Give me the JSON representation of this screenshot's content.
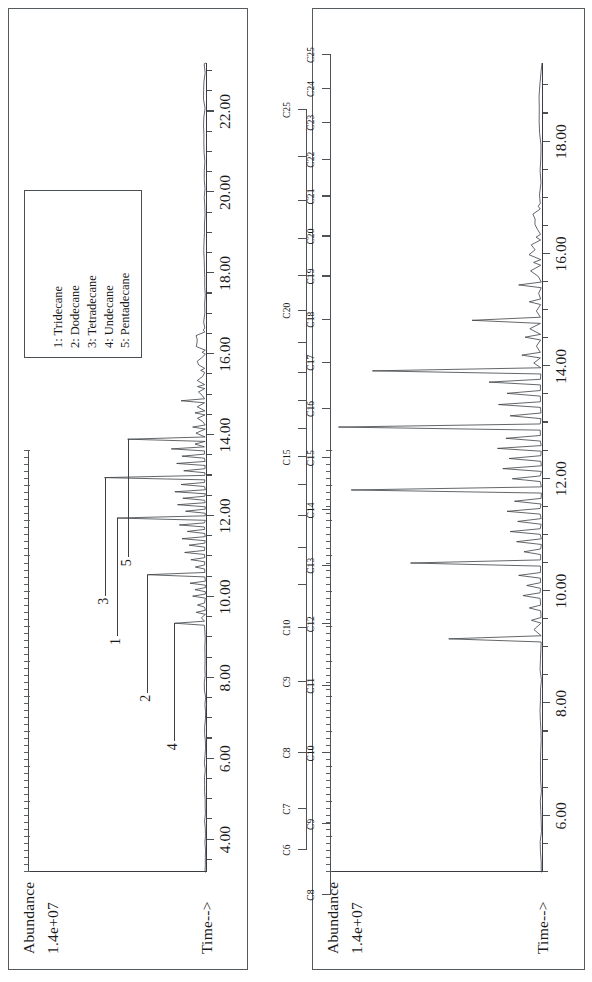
{
  "figure": {
    "type": "gas-chromatogram-pair",
    "panel_count": 2
  },
  "panel_a": {
    "name": "left-chromatogram",
    "y_axis": {
      "title": "Abundance",
      "scale_label": "1.4e+07",
      "max_value": 14000000
    },
    "x_axis": {
      "title": "Time-->",
      "tick_labels": [
        "4.00",
        "6.00",
        "8.00",
        "10.00",
        "12.00",
        "14.00",
        "16.00",
        "18.00",
        "20.00",
        "22.00"
      ],
      "tick_values": [
        4,
        6,
        8,
        10,
        12,
        14,
        16,
        18,
        20,
        22
      ],
      "range": [
        3.2,
        23.2
      ],
      "minor_tick_step": 0.5
    },
    "legend": {
      "entries": [
        "1: Tridecane",
        "2: Dodecane",
        "3: Tetradecane",
        "4: Undecane",
        "5: Pentadecane"
      ]
    },
    "callouts": [
      {
        "label": "1",
        "time": 11.95,
        "height": 0.5
      },
      {
        "label": "2",
        "time": 10.55,
        "height": 0.33
      },
      {
        "label": "3",
        "time": 12.95,
        "height": 0.57
      },
      {
        "label": "4",
        "time": 9.35,
        "height": 0.18
      },
      {
        "label": "5",
        "time": 13.9,
        "height": 0.44
      }
    ],
    "carbon_ruler": {
      "name": "carbon-number-ruler-left",
      "labels": [
        "C6",
        "C7",
        "C8",
        "C9",
        "C10",
        "",
        "",
        "",
        "",
        "C15",
        "",
        "",
        "",
        "",
        "C20",
        "",
        "",
        "",
        "",
        "C25"
      ],
      "times": [
        4.3,
        5.25,
        6.55,
        8.2,
        9.45,
        10.45,
        11.3,
        12.05,
        12.75,
        13.4,
        14.05,
        14.7,
        15.35,
        16.05,
        16.8,
        17.6,
        18.45,
        19.35,
        20.35,
        21.45
      ]
    }
  },
  "panel_b": {
    "name": "right-chromatogram",
    "y_axis": {
      "title": "Abundance",
      "scale_label": "1.4e+07",
      "max_value": 14000000
    },
    "x_axis": {
      "title": "Time-->",
      "tick_labels": [
        "6.00",
        "8.00",
        "10.00",
        "12.00",
        "14.00",
        "16.00",
        "18.00"
      ],
      "tick_values": [
        6,
        8,
        10,
        12,
        14,
        16,
        18
      ],
      "range": [
        5.0,
        19.4
      ],
      "minor_tick_step": 0.5
    },
    "carbon_ruler": {
      "name": "carbon-number-ruler-right",
      "labels": [
        "C8",
        "C9",
        "C10",
        "C11",
        "C12",
        "C13",
        "C14",
        "C15",
        "C16",
        "C17",
        "C18",
        "C19",
        "C20",
        "C21",
        "C22",
        "C23",
        "C24",
        "C25"
      ],
      "times": [
        5.45,
        6.6,
        7.75,
        8.85,
        9.85,
        10.8,
        11.7,
        12.55,
        13.35,
        14.1,
        14.8,
        15.5,
        16.15,
        16.8,
        17.4,
        18.0,
        18.55,
        19.1
      ]
    }
  },
  "chart_data": {
    "type": "line",
    "title": "",
    "xlabel": "Time-->",
    "ylabel": "Abundance",
    "series": [
      {
        "name": "panel_a_tic",
        "panel": "panel_a",
        "ylim": [
          0,
          14000000
        ],
        "xlim": [
          3.2,
          23.2
        ],
        "peaks": [
          {
            "time": 9.35,
            "rel_height": 0.175,
            "label": "4",
            "compound": "Undecane"
          },
          {
            "time": 9.62,
            "rel_height": 0.055
          },
          {
            "time": 9.8,
            "rel_height": 0.048
          },
          {
            "time": 10.02,
            "rel_height": 0.075
          },
          {
            "time": 10.18,
            "rel_height": 0.062
          },
          {
            "time": 10.34,
            "rel_height": 0.09
          },
          {
            "time": 10.55,
            "rel_height": 0.33,
            "label": "2",
            "compound": "Dodecane"
          },
          {
            "time": 10.74,
            "rel_height": 0.06
          },
          {
            "time": 10.92,
            "rel_height": 0.085
          },
          {
            "time": 11.1,
            "rel_height": 0.12
          },
          {
            "time": 11.28,
            "rel_height": 0.095
          },
          {
            "time": 11.44,
            "rel_height": 0.135
          },
          {
            "time": 11.62,
            "rel_height": 0.105
          },
          {
            "time": 11.78,
            "rel_height": 0.15
          },
          {
            "time": 11.95,
            "rel_height": 0.5,
            "label": "1",
            "compound": "Tridecane"
          },
          {
            "time": 12.12,
            "rel_height": 0.115
          },
          {
            "time": 12.28,
            "rel_height": 0.16
          },
          {
            "time": 12.44,
            "rel_height": 0.13
          },
          {
            "time": 12.6,
            "rel_height": 0.175
          },
          {
            "time": 12.78,
            "rel_height": 0.14
          },
          {
            "time": 12.95,
            "rel_height": 0.57,
            "label": "3",
            "compound": "Tetradecane"
          },
          {
            "time": 13.12,
            "rel_height": 0.125
          },
          {
            "time": 13.3,
            "rel_height": 0.165
          },
          {
            "time": 13.48,
            "rel_height": 0.135
          },
          {
            "time": 13.66,
            "rel_height": 0.195
          },
          {
            "time": 13.9,
            "rel_height": 0.44,
            "label": "5",
            "compound": "Pentadecane"
          },
          {
            "time": 14.2,
            "rel_height": 0.075
          },
          {
            "time": 14.55,
            "rel_height": 0.062
          },
          {
            "time": 14.85,
            "rel_height": 0.14
          },
          {
            "time": 15.2,
            "rel_height": 0.048
          },
          {
            "time": 15.6,
            "rel_height": 0.03
          },
          {
            "time": 16.05,
            "rel_height": 0.022
          },
          {
            "time": 16.6,
            "rel_height": 0.015
          }
        ]
      },
      {
        "name": "panel_b_tic",
        "panel": "panel_b",
        "ylim": [
          0,
          14000000
        ],
        "xlim": [
          5.0,
          19.4
        ],
        "peaks": [
          {
            "time": 9.15,
            "rel_height": 0.44,
            "carbon": "C11"
          },
          {
            "time": 9.48,
            "rel_height": 0.05
          },
          {
            "time": 9.7,
            "rel_height": 0.06
          },
          {
            "time": 9.92,
            "rel_height": 0.09
          },
          {
            "time": 10.1,
            "rel_height": 0.072
          },
          {
            "time": 10.28,
            "rel_height": 0.11
          },
          {
            "time": 10.5,
            "rel_height": 0.62,
            "carbon": "C12"
          },
          {
            "time": 10.7,
            "rel_height": 0.085
          },
          {
            "time": 10.88,
            "rel_height": 0.12
          },
          {
            "time": 11.06,
            "rel_height": 0.15
          },
          {
            "time": 11.24,
            "rel_height": 0.115
          },
          {
            "time": 11.42,
            "rel_height": 0.165
          },
          {
            "time": 11.6,
            "rel_height": 0.13
          },
          {
            "time": 11.8,
            "rel_height": 0.9,
            "carbon": "C13"
          },
          {
            "time": 12.0,
            "rel_height": 0.14
          },
          {
            "time": 12.18,
            "rel_height": 0.185
          },
          {
            "time": 12.36,
            "rel_height": 0.155
          },
          {
            "time": 12.54,
            "rel_height": 0.21
          },
          {
            "time": 12.72,
            "rel_height": 0.17
          },
          {
            "time": 12.92,
            "rel_height": 0.96,
            "carbon": "C14"
          },
          {
            "time": 13.12,
            "rel_height": 0.15
          },
          {
            "time": 13.32,
            "rel_height": 0.205
          },
          {
            "time": 13.52,
            "rel_height": 0.165
          },
          {
            "time": 13.72,
            "rel_height": 0.25
          },
          {
            "time": 13.92,
            "rel_height": 0.8,
            "carbon": "C15"
          },
          {
            "time": 14.2,
            "rel_height": 0.095
          },
          {
            "time": 14.52,
            "rel_height": 0.08
          },
          {
            "time": 14.82,
            "rel_height": 0.33,
            "carbon": "C16"
          },
          {
            "time": 15.15,
            "rel_height": 0.06
          },
          {
            "time": 15.45,
            "rel_height": 0.11
          },
          {
            "time": 15.85,
            "rel_height": 0.04
          },
          {
            "time": 16.3,
            "rel_height": 0.028
          },
          {
            "time": 16.85,
            "rel_height": 0.018
          }
        ]
      }
    ]
  },
  "colors": {
    "ink": "#1a1a1a",
    "rule": "#4d5256",
    "trace": "#3c4044",
    "background": "#ffffff"
  }
}
